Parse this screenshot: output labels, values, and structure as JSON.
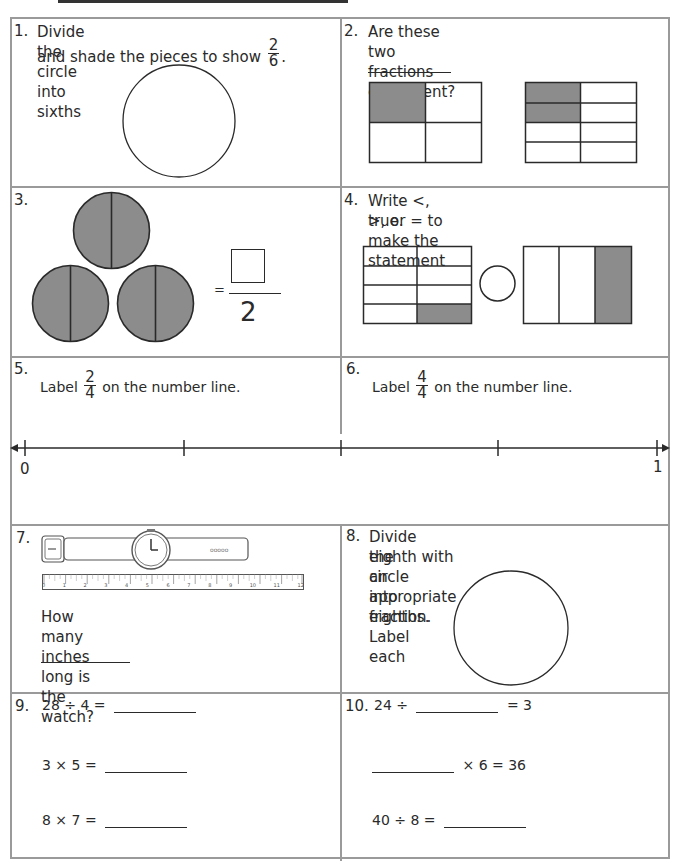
{
  "worksheet": {
    "q1": {
      "number": "1.",
      "line1": "Divide the circle into sixths",
      "line2": "and shade the pieces to show",
      "fraction": {
        "numerator": "2",
        "denominator": "6"
      },
      "suffix": "."
    },
    "q2": {
      "number": "2.",
      "text": "Are these two fractions equivalent?",
      "answer_blank": "",
      "model_a": {
        "rows": 2,
        "cols": 2,
        "shaded": 1
      },
      "model_b": {
        "rows": 4,
        "cols": 2,
        "shaded": 2
      }
    },
    "q3": {
      "number": "3.",
      "equals": "=",
      "numerator_box": "",
      "denominator": "2",
      "circles": 3,
      "halves_per_circle": 2,
      "shaded_halves": 6
    },
    "q4": {
      "number": "4.",
      "line1": "Write <, >, or = to make the statement",
      "line2": "true.",
      "model_a": {
        "rows": 4,
        "cols": 2,
        "shaded": 1
      },
      "model_b": {
        "rows": 1,
        "cols": 3,
        "shaded": 1
      },
      "compare_circle": ""
    },
    "q5": {
      "number": "5.",
      "prefix": "Label",
      "fraction": {
        "numerator": "2",
        "denominator": "4"
      },
      "suffix": "on the number line."
    },
    "q6": {
      "number": "6.",
      "prefix": "Label",
      "fraction": {
        "numerator": "4",
        "denominator": "4"
      },
      "suffix": "on the number line."
    },
    "number_line": {
      "start_label": "0",
      "end_label": "1",
      "ticks": 5
    },
    "q7": {
      "number": "7.",
      "question": "How many inches long is the watch?",
      "answer_blank": "",
      "ruler_labels": [
        "0",
        "1",
        "2",
        "3",
        "4",
        "5",
        "6",
        "7",
        "8",
        "9",
        "10",
        "11",
        "12"
      ],
      "strap_holes": "ooooo"
    },
    "q8": {
      "number": "8.",
      "line1": "Divide the circle into eighths. Label each",
      "line2": "eighth with an appropriate fraction."
    },
    "q9": {
      "number": "9.",
      "problems": [
        "28 ÷ 4 =",
        "3 × 5 =",
        "8 × 7 ="
      ]
    },
    "q10": {
      "number": "10.",
      "p1_left": "24 ÷",
      "p1_right": "= 3",
      "p2_right": "× 6 = 36",
      "p3_left": "40 ÷ 8 ="
    },
    "colors": {
      "border": "#9a9a9a",
      "ink": "#2a2a2a",
      "shade": "#8c8c8c"
    }
  }
}
